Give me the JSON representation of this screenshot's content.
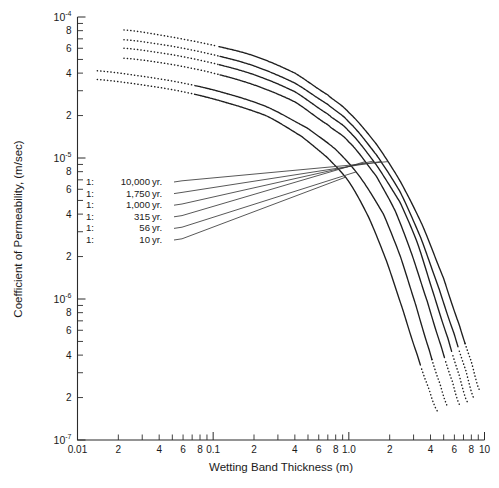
{
  "chart_data": {
    "type": "line",
    "title": "",
    "xlabel": "Wetting Band Thickness (m)",
    "ylabel": "Coefficient of Permeability, (m/sec)",
    "xscale": "log",
    "yscale": "log",
    "xlim": [
      0.01,
      10
    ],
    "ylim": [
      1e-07,
      0.0001
    ],
    "grid": false,
    "legend_position": "inside-left",
    "x_decade_labels": [
      "0.01",
      "0.1",
      "1.0",
      "10"
    ],
    "x_minor_labels": [
      "2",
      "4",
      "6",
      "8"
    ],
    "y_decade_labels": [
      "10-4",
      "10-5",
      "10-6",
      "10-7"
    ],
    "y_decade_mantissa": [
      "10",
      "10",
      "10",
      "10"
    ],
    "y_decade_exponent": [
      "-4",
      "-5",
      "-6",
      "-7"
    ],
    "y_minor_labels": [
      "8",
      "6",
      "4",
      "2"
    ],
    "series": [
      {
        "name": "1: 10,000 yr.",
        "legend_ratio": "1:",
        "legend_value": "10,000",
        "legend_unit": "yr.",
        "points": [
          [
            0.022,
            8.1e-05
          ],
          [
            0.05,
            7.2e-05
          ],
          [
            0.1,
            6.3e-05
          ],
          [
            0.2,
            5.3e-05
          ],
          [
            0.4,
            4e-05
          ],
          [
            0.7,
            2.8e-05
          ],
          [
            1.0,
            2.1e-05
          ],
          [
            1.6,
            1.25e-05
          ],
          [
            2.4,
            6.8e-06
          ],
          [
            3.5,
            3.3e-06
          ],
          [
            5.0,
            1.4e-06
          ],
          [
            6.5,
            6.6e-07
          ],
          [
            8.0,
            3.6e-07
          ],
          [
            9.3,
            2.2e-07
          ]
        ],
        "solid_range": [
          0.11,
          7.2
        ]
      },
      {
        "name": "1: 1,750 yr.",
        "legend_ratio": "1:",
        "legend_value": "1,750",
        "legend_unit": "yr.",
        "points": [
          [
            0.022,
            6.9e-05
          ],
          [
            0.05,
            6.2e-05
          ],
          [
            0.1,
            5.4e-05
          ],
          [
            0.2,
            4.5e-05
          ],
          [
            0.4,
            3.4e-05
          ],
          [
            0.7,
            2.4e-05
          ],
          [
            1.0,
            1.8e-05
          ],
          [
            1.6,
            1.05e-05
          ],
          [
            2.4,
            5.7e-06
          ],
          [
            3.4,
            2.7e-06
          ],
          [
            4.6,
            1.2e-06
          ],
          [
            6.0,
            5.6e-07
          ],
          [
            7.3,
            3.1e-07
          ],
          [
            8.4,
            1.95e-07
          ]
        ],
        "solid_range": [
          0.11,
          6.5
        ]
      },
      {
        "name": "1: 1,000 yr.",
        "legend_ratio": "1:",
        "legend_value": "1,000",
        "legend_unit": "yr.",
        "points": [
          [
            0.022,
            6e-05
          ],
          [
            0.05,
            5.4e-05
          ],
          [
            0.1,
            4.7e-05
          ],
          [
            0.2,
            3.9e-05
          ],
          [
            0.4,
            2.95e-05
          ],
          [
            0.7,
            2.05e-05
          ],
          [
            1.0,
            1.55e-05
          ],
          [
            1.6,
            8.9e-06
          ],
          [
            2.4,
            4.8e-06
          ],
          [
            3.2,
            2.5e-06
          ],
          [
            4.2,
            1.1e-06
          ],
          [
            5.4,
            5.2e-07
          ],
          [
            6.5,
            2.9e-07
          ],
          [
            7.5,
            1.85e-07
          ]
        ],
        "solid_range": [
          0.11,
          5.8
        ]
      },
      {
        "name": "1: 315 yr.",
        "legend_ratio": "1:",
        "legend_value": "315",
        "legend_unit": "yr.",
        "points": [
          [
            0.022,
            5.1e-05
          ],
          [
            0.05,
            4.6e-05
          ],
          [
            0.1,
            4e-05
          ],
          [
            0.2,
            3.3e-05
          ],
          [
            0.4,
            2.5e-05
          ],
          [
            0.7,
            1.72e-05
          ],
          [
            1.0,
            1.3e-05
          ],
          [
            1.6,
            7.4e-06
          ],
          [
            2.2,
            4.2e-06
          ],
          [
            2.9,
            2.1e-06
          ],
          [
            3.8,
            9.5e-07
          ],
          [
            4.8,
            4.6e-07
          ],
          [
            5.8,
            2.6e-07
          ],
          [
            6.6,
            1.75e-07
          ]
        ],
        "solid_range": [
          0.11,
          5.1
        ]
      },
      {
        "name": "1: 56 yr.",
        "legend_ratio": "1:",
        "legend_value": "56",
        "legend_unit": "yr.",
        "points": [
          [
            0.014,
            4.15e-05
          ],
          [
            0.03,
            3.8e-05
          ],
          [
            0.06,
            3.4e-05
          ],
          [
            0.12,
            2.9e-05
          ],
          [
            0.25,
            2.3e-05
          ],
          [
            0.5,
            1.62e-05
          ],
          [
            0.8,
            1.15e-05
          ],
          [
            1.2,
            7.4e-06
          ],
          [
            1.8,
            4e-06
          ],
          [
            2.4,
            2e-06
          ],
          [
            3.1,
            9.2e-07
          ],
          [
            3.9,
            4.4e-07
          ],
          [
            4.7,
            2.5e-07
          ],
          [
            5.4,
            1.7e-07
          ]
        ],
        "solid_range": [
          0.072,
          4.1
        ]
      },
      {
        "name": "1: 10 yr.",
        "legend_ratio": "1:",
        "legend_value": "10",
        "legend_unit": "yr.",
        "points": [
          [
            0.014,
            3.6e-05
          ],
          [
            0.03,
            3.3e-05
          ],
          [
            0.06,
            2.95e-05
          ],
          [
            0.12,
            2.5e-05
          ],
          [
            0.25,
            1.98e-05
          ],
          [
            0.45,
            1.42e-05
          ],
          [
            0.7,
            1e-05
          ],
          [
            1.0,
            6.8e-06
          ],
          [
            1.4,
            3.8e-06
          ],
          [
            1.9,
            1.85e-06
          ],
          [
            2.5,
            8.4e-07
          ],
          [
            3.2,
            4e-07
          ],
          [
            3.9,
            2.3e-07
          ],
          [
            4.5,
            1.6e-07
          ]
        ],
        "solid_range": [
          0.072,
          3.4
        ]
      }
    ],
    "colors": {
      "curve": "#1f1f1f",
      "axis": "#2b2b2b",
      "leader": "#3a3a3a",
      "background": "#ffffff"
    }
  }
}
